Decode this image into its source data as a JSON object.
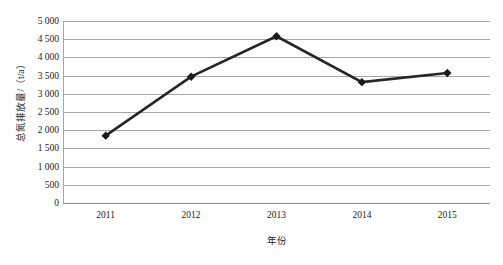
{
  "chart_data": {
    "type": "line",
    "title": "",
    "subtitle": "",
    "xlabel": "年份",
    "ylabel": "总氮排放量/（t/a）",
    "categories": [
      "2011",
      "2012",
      "2013",
      "2014",
      "2015"
    ],
    "values": [
      1850,
      3470,
      4580,
      3320,
      3570
    ],
    "series": [
      {
        "name": "总氮排放量",
        "values": [
          1850,
          3470,
          4580,
          3320,
          3570
        ]
      }
    ],
    "ylim": [
      0,
      5000
    ],
    "ytick_step": 500,
    "ytick_labels": [
      "5 000",
      "4 500",
      "4 000",
      "3 500",
      "3 000",
      "2 500",
      "2 000",
      "1 500",
      "1 000",
      "500",
      "0"
    ],
    "ytick_values": [
      5000,
      4500,
      4000,
      3500,
      3000,
      2500,
      2000,
      1500,
      1000,
      500,
      0
    ],
    "xtick_labels": [
      "2011",
      "2012",
      "2013",
      "2014",
      "2015"
    ],
    "grid": "horizontal",
    "legend": "none",
    "marker": "diamond",
    "colors": {
      "line": "#262626",
      "marker": "#1a1a1a",
      "gridline": "#a6a6a6",
      "axis": "#8c8c8c",
      "text": "#1a1a1a",
      "background": "#ffffff"
    }
  }
}
